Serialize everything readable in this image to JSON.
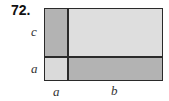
{
  "problem": {
    "number": "72."
  },
  "diagram": {
    "side_labels": {
      "left_top": "c",
      "left_bottom": "a",
      "bottom_left": "a",
      "bottom_right": "b"
    },
    "regions": [
      {
        "name": "a-by-c",
        "color": "#b3b3b3"
      },
      {
        "name": "b-by-c",
        "color": "#dedede"
      },
      {
        "name": "a-by-a",
        "color": "#dadada"
      },
      {
        "name": "b-by-a",
        "color": "#b3b3b3"
      }
    ],
    "stroke_color": "#2a2a2a"
  }
}
